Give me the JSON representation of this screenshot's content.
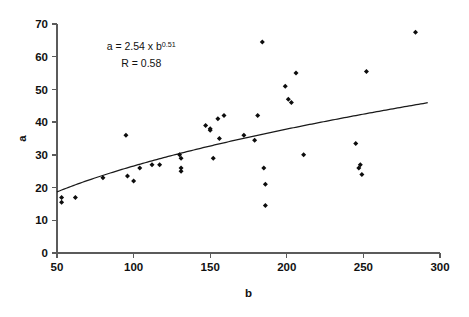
{
  "chart_data": {
    "type": "scatter",
    "title": "",
    "xlabel": "b",
    "ylabel": "a",
    "xlim": [
      50,
      300
    ],
    "ylim": [
      0,
      70
    ],
    "xticks": [
      50,
      100,
      150,
      200,
      250,
      300
    ],
    "yticks": [
      0,
      10,
      20,
      30,
      40,
      50,
      60,
      70
    ],
    "grid": false,
    "legend": null,
    "annotations": [
      {
        "id": "equation",
        "text": "a = 2.54 x b0.51",
        "base": "a = 2.54 x b",
        "exponent": "0.51",
        "x": 105,
        "y": 62
      },
      {
        "id": "correlation",
        "text": "R = 0.58",
        "x": 105,
        "y": 57
      }
    ],
    "series": [
      {
        "name": "observations",
        "marker": "diamond",
        "color": "#0d0d0d",
        "points": [
          [
            53,
            17
          ],
          [
            53,
            15.5
          ],
          [
            62,
            17
          ],
          [
            80,
            23
          ],
          [
            95,
            36
          ],
          [
            96,
            23.5
          ],
          [
            100,
            22
          ],
          [
            104,
            26
          ],
          [
            112,
            27
          ],
          [
            117,
            27
          ],
          [
            130,
            30
          ],
          [
            131,
            29
          ],
          [
            131,
            26
          ],
          [
            131,
            25
          ],
          [
            147,
            39
          ],
          [
            150,
            38
          ],
          [
            150,
            37.5
          ],
          [
            152,
            29
          ],
          [
            155,
            41
          ],
          [
            156,
            35
          ],
          [
            159,
            42
          ],
          [
            172,
            36
          ],
          [
            179,
            34.5
          ],
          [
            181,
            42
          ],
          [
            184,
            64.5
          ],
          [
            185,
            26
          ],
          [
            186,
            21
          ],
          [
            186,
            14.5
          ],
          [
            199,
            51
          ],
          [
            201,
            47
          ],
          [
            203,
            46
          ],
          [
            206,
            55
          ],
          [
            211,
            30
          ],
          [
            245,
            33.5
          ],
          [
            247,
            26
          ],
          [
            248,
            27
          ],
          [
            249,
            24
          ],
          [
            252,
            55.5
          ],
          [
            284,
            67.5
          ]
        ]
      }
    ],
    "fit_curve": {
      "name": "power-fit",
      "equation": "a = 2.54 * b^0.51",
      "r": 0.58,
      "coefficient": 2.54,
      "exponent": 0.51,
      "color": "#1a1a1a",
      "x_start": 50,
      "x_end": 292
    }
  }
}
